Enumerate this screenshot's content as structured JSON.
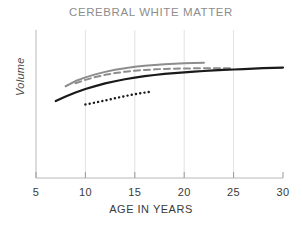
{
  "chart_data": {
    "type": "line",
    "title": "CEREBRAL WHITE MATTER",
    "xlabel": "AGE IN YEARS",
    "ylabel": "Volume",
    "xlim": [
      5,
      30
    ],
    "ylim": [
      0,
      1
    ],
    "xticks": [
      5,
      10,
      15,
      20,
      25,
      30
    ],
    "xticklabels": [
      "5",
      "10",
      "15",
      "20",
      "25",
      "30"
    ],
    "yticks": [],
    "yticklabels": [],
    "grid": "vertical-only",
    "gridlines_x": [
      10,
      15,
      20,
      25
    ],
    "legend": "none",
    "series": [
      {
        "name": "gray-solid-upper",
        "style": "solid",
        "color": "#8d8d8d",
        "width": 2.0,
        "x": [
          8,
          9,
          10,
          11,
          12,
          13,
          14,
          15,
          16,
          17,
          18,
          19,
          20,
          21,
          22
        ],
        "y": [
          0.62,
          0.655,
          0.68,
          0.7,
          0.717,
          0.731,
          0.742,
          0.751,
          0.758,
          0.764,
          0.769,
          0.772,
          0.775,
          0.777,
          0.778
        ]
      },
      {
        "name": "gray-dashed",
        "style": "dashed",
        "color": "#8d8d8d",
        "width": 2.0,
        "x": [
          9,
          10,
          11,
          12,
          13,
          14,
          15,
          16,
          17,
          18,
          19,
          20,
          21,
          22,
          23,
          24,
          25
        ],
        "y": [
          0.64,
          0.663,
          0.682,
          0.697,
          0.709,
          0.718,
          0.725,
          0.73,
          0.734,
          0.737,
          0.739,
          0.74,
          0.741,
          0.742,
          0.742,
          0.742,
          0.742
        ]
      },
      {
        "name": "black-solid",
        "style": "solid",
        "color": "#1a1a1a",
        "width": 2.2,
        "x": [
          7,
          8,
          9,
          10,
          11,
          12,
          13,
          14,
          15,
          16,
          17,
          18,
          19,
          20,
          21,
          22,
          23,
          24,
          25,
          26,
          27,
          28,
          29,
          30
        ],
        "y": [
          0.52,
          0.551,
          0.578,
          0.601,
          0.621,
          0.639,
          0.654,
          0.667,
          0.678,
          0.688,
          0.696,
          0.703,
          0.709,
          0.714,
          0.719,
          0.723,
          0.727,
          0.73,
          0.733,
          0.736,
          0.739,
          0.742,
          0.744,
          0.746
        ]
      },
      {
        "name": "black-dotted",
        "style": "dotted",
        "color": "#1a1a1a",
        "width": 2.4,
        "x": [
          10,
          10.5,
          11,
          11.5,
          12,
          12.5,
          13,
          13.5,
          14,
          14.5,
          15,
          15.5,
          16,
          16.5
        ],
        "y": [
          0.497,
          0.503,
          0.51,
          0.517,
          0.524,
          0.531,
          0.539,
          0.546,
          0.553,
          0.56,
          0.566,
          0.572,
          0.577,
          0.582
        ]
      }
    ]
  },
  "axes": {
    "spine_color": "#b8b8b8",
    "grid_color": "#e2e2e2",
    "tick_color": "#9a9a9a"
  }
}
